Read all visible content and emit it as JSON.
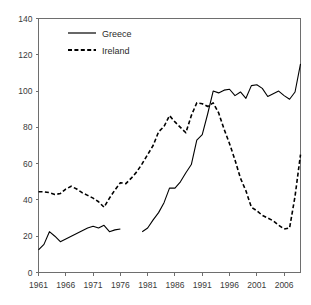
{
  "chart_data": {
    "type": "line",
    "title": "",
    "subtitle": "",
    "xlabel": "",
    "ylabel": "",
    "xlim": [
      1961,
      2009
    ],
    "ylim": [
      0,
      140
    ],
    "grid": false,
    "legend_position": "top-left",
    "y_ticks": [
      0,
      20,
      40,
      60,
      80,
      100,
      120,
      140
    ],
    "x_ticks": [
      1961,
      1966,
      1971,
      1976,
      1981,
      1986,
      1991,
      1996,
      2001,
      2006
    ],
    "x_tick_labels": [
      "1961",
      "1966",
      "1971",
      "1976",
      "1981",
      "1986",
      "1991",
      "1996",
      "2001",
      "2006"
    ],
    "y_tick_labels": [
      "0",
      "20",
      "40",
      "60",
      "80",
      "100",
      "120",
      "140"
    ],
    "series": [
      {
        "name": "Greece",
        "style": "solid",
        "color": "#000000",
        "x": [
          1961,
          1962,
          1963,
          1964,
          1965,
          1966,
          1967,
          1968,
          1969,
          1970,
          1971,
          1972,
          1973,
          1974,
          1975,
          1976,
          1980,
          1981,
          1982,
          1983,
          1984,
          1985,
          1986,
          1987,
          1988,
          1989,
          1990,
          1991,
          1992,
          1993,
          1994,
          1995,
          1996,
          1997,
          1998,
          1999,
          2000,
          2001,
          2002,
          2003,
          2004,
          2005,
          2006,
          2007,
          2008,
          2009
        ],
        "values": [
          12.5,
          15.5,
          22.5,
          20.0,
          17.0,
          18.5,
          20.0,
          21.5,
          23.0,
          24.5,
          25.5,
          24.5,
          26.0,
          22.5,
          23.5,
          24.0,
          22.5,
          24.5,
          29.0,
          33.0,
          38.5,
          46.5,
          46.5,
          50.0,
          55.0,
          59.5,
          73.0,
          76.0,
          87.5,
          100.0,
          99.0,
          100.5,
          101.0,
          97.5,
          99.5,
          96.0,
          103.0,
          103.5,
          101.5,
          97.0,
          98.5,
          100.0,
          97.5,
          95.5,
          99.5,
          115.0
        ]
      },
      {
        "name": "Ireland",
        "style": "dashed",
        "color": "#000000",
        "x": [
          1961,
          1962,
          1963,
          1964,
          1965,
          1966,
          1967,
          1968,
          1969,
          1970,
          1971,
          1972,
          1973,
          1974,
          1975,
          1976,
          1977,
          1978,
          1979,
          1980,
          1981,
          1982,
          1983,
          1984,
          1985,
          1986,
          1987,
          1988,
          1989,
          1990,
          1991,
          1992,
          1993,
          1994,
          1995,
          1996,
          1997,
          1998,
          1999,
          2000,
          2001,
          2002,
          2003,
          2004,
          2005,
          2006,
          2007,
          2008,
          2009
        ],
        "values": [
          44.5,
          44.5,
          44.0,
          43.0,
          43.5,
          46.0,
          47.5,
          46.0,
          44.0,
          42.5,
          41.0,
          39.0,
          36.0,
          41.0,
          45.5,
          49.5,
          49.0,
          52.0,
          55.5,
          60.0,
          65.0,
          70.0,
          77.5,
          80.5,
          86.5,
          83.0,
          80.0,
          77.0,
          86.5,
          93.5,
          93.0,
          91.5,
          93.5,
          88.0,
          79.0,
          71.0,
          62.0,
          52.0,
          45.0,
          36.0,
          34.0,
          31.5,
          30.0,
          28.5,
          26.0,
          24.0,
          24.5,
          42.0,
          65.0
        ]
      }
    ],
    "annotations": [
      {
        "text": "Greece",
        "type": "legend-entry"
      },
      {
        "text": "Ireland",
        "type": "legend-entry"
      }
    ]
  },
  "legend": {
    "items": [
      {
        "label": "Greece",
        "style": "solid"
      },
      {
        "label": "Ireland",
        "style": "dashed"
      }
    ]
  }
}
